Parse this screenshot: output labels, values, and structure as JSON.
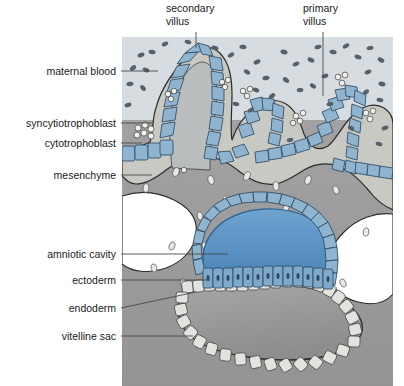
{
  "figure": {
    "panel": {
      "x": 122,
      "y": 37,
      "width": 271,
      "height": 349
    }
  },
  "palette": {
    "maternal_blood_space": "#d7dce0",
    "blood_cell": "#55616b",
    "mesenchyme": "#9d9d9d",
    "mesenchyme_dark": "#8e8e8e",
    "syncytiotrophoblast": "#c9c9c4",
    "cytotrophoblast_cell": "#8fb4cf",
    "cytotrophoblast_stroke": "#2e4a63",
    "villus_core": "#b9bdbd",
    "amniotic_cavity": "#5b93c4",
    "amnion_cell": "#8fb4cf",
    "ectoderm_cell": "#7fa9c9",
    "endoderm_cell": "#e2e2df",
    "vitelline_sac": "#9a9a9a",
    "lacuna": "#ffffff",
    "outline": "#2b2b2b",
    "leader_line": "#4a4a4a",
    "label_text": "#1a1a1a",
    "background": "#ffffff"
  },
  "labels": [
    {
      "id": "secondary-villus",
      "text_lines": [
        "secondary",
        "villus"
      ],
      "text": "secondary villus",
      "side": "top",
      "text_x": 166,
      "text_y": 12,
      "leader": "M 196 32 L 196 48"
    },
    {
      "id": "primary-villus",
      "text_lines": [
        "primary",
        "villus"
      ],
      "text": "primary villus",
      "side": "top",
      "text_x": 303,
      "text_y": 12,
      "leader": "M 323 32 L 323 96"
    },
    {
      "id": "maternal-blood",
      "text_lines": [
        "maternal blood"
      ],
      "text": "maternal blood",
      "side": "left",
      "text_x": 116,
      "text_y": 75,
      "leader": "M 121 71 L 158 71"
    },
    {
      "id": "syncytiotrophoblast",
      "text_lines": [
        "syncytiotrophoblast"
      ],
      "text": "syncytiotrophoblast",
      "side": "left",
      "text_x": 116,
      "text_y": 127,
      "leader": "M 121 123 L 152 123"
    },
    {
      "id": "cytotrophoblast",
      "text_lines": [
        "cytotrophoblast"
      ],
      "text": "cytotrophoblast",
      "side": "left",
      "text_x": 116,
      "text_y": 147,
      "leader": "M 121 143 L 142 143"
    },
    {
      "id": "mesenchyme",
      "text_lines": [
        "mesenchyme"
      ],
      "text": "mesenchyme",
      "side": "left",
      "text_x": 116,
      "text_y": 179,
      "leader": "M 121 175 L 152 175"
    },
    {
      "id": "amniotic-cavity",
      "text_lines": [
        "amniotic cavity"
      ],
      "text": "amniotic cavity",
      "side": "left",
      "text_x": 116,
      "text_y": 258,
      "leader": "M 121 254 L 228 254"
    },
    {
      "id": "ectoderm",
      "text_lines": [
        "ectoderm"
      ],
      "text": "ectoderm",
      "side": "left",
      "text_x": 116,
      "text_y": 284,
      "leader": "M 121 280 L 210 280"
    },
    {
      "id": "endoderm",
      "text_lines": [
        "endoderm"
      ],
      "text": "endoderm",
      "side": "left",
      "text_x": 116,
      "text_y": 312,
      "leader": "M 121 308 L 196 292"
    },
    {
      "id": "vitelline-sac",
      "text_lines": [
        "vitelline sac"
      ],
      "text": "vitelline sac",
      "side": "left",
      "text_x": 116,
      "text_y": 340,
      "leader": "M 121 336 L 193 336"
    }
  ],
  "structures": {
    "maternal_blood_space": "lacunar space filled with maternal erythrocytes",
    "secondary_villus": "villus with mesenchymal core covered by cytotrophoblast and syncytiotrophoblast",
    "primary_villus": "villus consisting of cytotrophoblast covered by syncytiotrophoblast",
    "syncytiotrophoblast": "outer multinucleated layer with nuclear clusters",
    "cytotrophoblast": "inner layer of cuboidal blue cells",
    "mesenchyme": "extraembryonic mesenchyme with lacunae",
    "amniotic_cavity": "blue-filled cavity roofed by amnion",
    "ectoderm": "columnar epiblast layer of the bilaminar disc",
    "endoderm": "flat hypoblast cells lining the vitelline sac",
    "vitelline_sac": "primary yolk sac cavity"
  }
}
